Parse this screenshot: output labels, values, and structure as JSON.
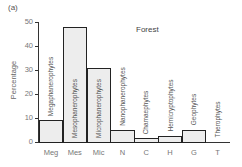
{
  "chart_data": {
    "type": "bar",
    "panel_label": "(a)",
    "title": "Forest",
    "xlabel": "",
    "ylabel": "Percentage",
    "ylim": [
      0,
      50
    ],
    "yticks": [
      0,
      10,
      20,
      30,
      40,
      50
    ],
    "grid": false,
    "legend": null,
    "categories": [
      "Meg",
      "Mes",
      "Mic",
      "N",
      "C",
      "H",
      "G",
      "T"
    ],
    "category_names": [
      "Megaphanerophytes",
      "Mesophanerophytes",
      "Microphanerophytes",
      "Nanophanerophytes",
      "Chamaephytes",
      "Hemicryptophytes",
      "Geophytes",
      "Therophytes"
    ],
    "values": [
      9,
      48,
      31,
      5,
      1.5,
      2.5,
      5,
      0
    ],
    "bar_color": "#ededed",
    "edge_color": "#222222"
  },
  "ytick_labels": [
    "0",
    "10",
    "20",
    "30",
    "40",
    "50"
  ]
}
